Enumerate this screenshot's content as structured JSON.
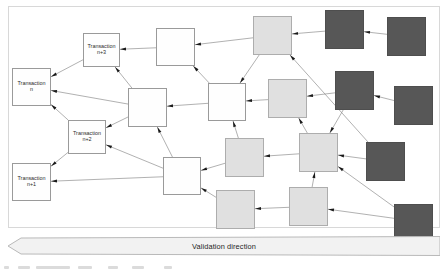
{
  "figure": {
    "type": "dag-tangle-diagram",
    "background_color": "#ffffff",
    "frame_color": "#d8d8d8",
    "edge_color": "#8f8f8f",
    "arrowhead_color": "#1a1a1a"
  },
  "legend_colors": {
    "white_node": "#fefefe",
    "light_node": "#e0e0e0",
    "dark_node": "#575757",
    "node_border": "#9a9a9a"
  },
  "banner": {
    "label": "Validation direction",
    "direction": "left",
    "fill": "#f2f2f2",
    "stroke": "#b9b9b9"
  },
  "nodes": [
    {
      "id": "tx_n",
      "label_lines": [
        "Transaction",
        "n"
      ],
      "style": "white",
      "x": 12,
      "y": 68,
      "w": 39,
      "h": 38
    },
    {
      "id": "tx_n3",
      "label_lines": [
        "Transaction",
        "n+3"
      ],
      "style": "white",
      "x": 83,
      "y": 33,
      "w": 37,
      "h": 34
    },
    {
      "id": "tx_n2",
      "label_lines": [
        "Transaction",
        "n+2"
      ],
      "style": "white",
      "x": 68,
      "y": 120,
      "w": 38,
      "h": 34
    },
    {
      "id": "tx_n1",
      "label_lines": [
        "Transaction",
        "n+1"
      ],
      "style": "white",
      "x": 12,
      "y": 163,
      "w": 39,
      "h": 38
    },
    {
      "id": "w1",
      "label_lines": [],
      "style": "white",
      "x": 156,
      "y": 28,
      "w": 39,
      "h": 38
    },
    {
      "id": "w2",
      "label_lines": [],
      "style": "white",
      "x": 128,
      "y": 88,
      "w": 39,
      "h": 39
    },
    {
      "id": "w3",
      "label_lines": [],
      "style": "white",
      "x": 208,
      "y": 83,
      "w": 38,
      "h": 38
    },
    {
      "id": "w4",
      "label_lines": [],
      "style": "white",
      "x": 163,
      "y": 157,
      "w": 38,
      "h": 38
    },
    {
      "id": "l1",
      "label_lines": [],
      "style": "light",
      "x": 253,
      "y": 16,
      "w": 39,
      "h": 39
    },
    {
      "id": "l2",
      "label_lines": [],
      "style": "light",
      "x": 268,
      "y": 79,
      "w": 39,
      "h": 39
    },
    {
      "id": "l3",
      "label_lines": [],
      "style": "light",
      "x": 225,
      "y": 138,
      "w": 39,
      "h": 39
    },
    {
      "id": "l4",
      "label_lines": [],
      "style": "light",
      "x": 299,
      "y": 133,
      "w": 39,
      "h": 39
    },
    {
      "id": "l5",
      "label_lines": [],
      "style": "light",
      "x": 216,
      "y": 190,
      "w": 39,
      "h": 39
    },
    {
      "id": "l6",
      "label_lines": [],
      "style": "light",
      "x": 289,
      "y": 187,
      "w": 39,
      "h": 39
    },
    {
      "id": "d1",
      "label_lines": [],
      "style": "dark",
      "x": 325,
      "y": 10,
      "w": 39,
      "h": 39
    },
    {
      "id": "d2",
      "label_lines": [],
      "style": "dark",
      "x": 387,
      "y": 17,
      "w": 39,
      "h": 39
    },
    {
      "id": "d3",
      "label_lines": [],
      "style": "dark",
      "x": 335,
      "y": 71,
      "w": 39,
      "h": 39
    },
    {
      "id": "d4",
      "label_lines": [],
      "style": "dark",
      "x": 394,
      "y": 86,
      "w": 39,
      "h": 39
    },
    {
      "id": "d5",
      "label_lines": [],
      "style": "dark",
      "x": 366,
      "y": 142,
      "w": 39,
      "h": 39
    },
    {
      "id": "d6",
      "label_lines": [],
      "style": "dark",
      "x": 394,
      "y": 204,
      "w": 39,
      "h": 34
    }
  ],
  "edges": [
    {
      "from": "tx_n3",
      "to": "tx_n"
    },
    {
      "from": "tx_n2",
      "to": "tx_n"
    },
    {
      "from": "tx_n2",
      "to": "tx_n1"
    },
    {
      "from": "w1",
      "to": "tx_n3"
    },
    {
      "from": "w2",
      "to": "tx_n"
    },
    {
      "from": "w2",
      "to": "tx_n3"
    },
    {
      "from": "w2",
      "to": "tx_n2"
    },
    {
      "from": "w3",
      "to": "w1"
    },
    {
      "from": "w3",
      "to": "w2"
    },
    {
      "from": "w4",
      "to": "tx_n2"
    },
    {
      "from": "w4",
      "to": "tx_n1"
    },
    {
      "from": "w4",
      "to": "w2"
    },
    {
      "from": "l1",
      "to": "w1"
    },
    {
      "from": "l1",
      "to": "w3"
    },
    {
      "from": "l2",
      "to": "w3"
    },
    {
      "from": "l3",
      "to": "w3"
    },
    {
      "from": "l3",
      "to": "w4"
    },
    {
      "from": "l5",
      "to": "w4"
    },
    {
      "from": "l4",
      "to": "l3"
    },
    {
      "from": "l4",
      "to": "l2"
    },
    {
      "from": "l6",
      "to": "l5"
    },
    {
      "from": "l6",
      "to": "l4"
    },
    {
      "from": "d1",
      "to": "l1"
    },
    {
      "from": "d2",
      "to": "d1"
    },
    {
      "from": "d3",
      "to": "l2"
    },
    {
      "from": "d3",
      "to": "l4"
    },
    {
      "from": "d4",
      "to": "d3"
    },
    {
      "from": "d5",
      "to": "l4"
    },
    {
      "from": "d5",
      "to": "l1"
    },
    {
      "from": "d6",
      "to": "l6"
    },
    {
      "from": "d6",
      "to": "l4"
    }
  ],
  "caption_fragment_blobs": [
    {
      "x": 0,
      "w": 5
    },
    {
      "x": 14,
      "w": 12
    },
    {
      "x": 32,
      "w": 34
    },
    {
      "x": 74,
      "w": 14
    },
    {
      "x": 104,
      "w": 10
    },
    {
      "x": 128,
      "w": 12
    },
    {
      "x": 160,
      "w": 8
    }
  ]
}
